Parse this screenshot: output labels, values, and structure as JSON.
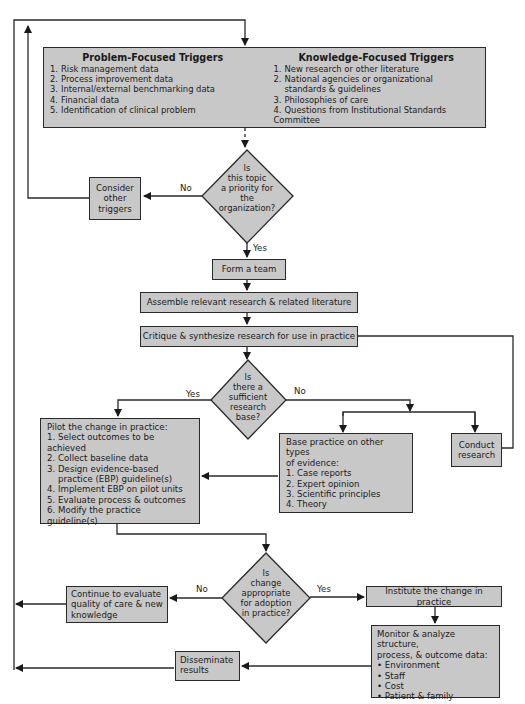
{
  "triggers": {
    "problem": {
      "title": "Problem-Focused Triggers",
      "items": [
        "Risk management data",
        "Process improvement data",
        "Internal/external benchmarking data",
        "Financial data",
        "Identification of clinical problem"
      ]
    },
    "knowledge": {
      "title": "Knowledge-Focused Triggers",
      "items": [
        "New research or other literature",
        "National agencies or organizational",
        "standards & guidelines",
        "Philosophies of care",
        "Questions from Institutional Standards Committee"
      ],
      "numbers": [
        "1.",
        "2.",
        "",
        "3.",
        "4."
      ]
    }
  },
  "decision_priority": {
    "lines": [
      "Is",
      "this topic",
      "a priority for",
      "the",
      "organization?"
    ],
    "no_label": "No",
    "yes_label": "Yes"
  },
  "consider_other_triggers": "Consider other triggers",
  "form_team": "Form a team",
  "assemble": "Assemble relevant research & related literature",
  "critique": "Critique & synthesize research for use in practice",
  "decision_research": {
    "lines": [
      "Is",
      "there a",
      "sufficient",
      "research",
      "base?"
    ],
    "yes_label": "Yes",
    "no_label": "No"
  },
  "pilot": {
    "title": "Pilot the change in practice:",
    "items": [
      "Select outcomes to be achieved",
      "Collect baseline data",
      "Design evidence-based",
      "practice (EBP) guideline(s)",
      "Implement EBP on pilot units",
      "Evaluate process & outcomes",
      "Modify the practice guideline(s)"
    ],
    "numbers": [
      "1.",
      "2.",
      "3.",
      "",
      "4.",
      "5.",
      "6."
    ]
  },
  "base_practice": {
    "title_line1": "Base practice on other types",
    "title_line2": "of evidence:",
    "items": [
      "Case reports",
      "Expert opinion",
      "Scientific principles",
      "Theory"
    ],
    "numbers": [
      "1.",
      "2.",
      "3.",
      "4."
    ]
  },
  "conduct_research": "Conduct research",
  "decision_adoption": {
    "lines": [
      "Is",
      "change",
      "appropriate",
      "for adoption",
      "in practice?"
    ],
    "no_label": "No",
    "yes_label": "Yes"
  },
  "continue_evaluate": {
    "lines": [
      "Continue to evaluate",
      "quality of care & new",
      "knowledge"
    ]
  },
  "institute_change": "Institute the change in practice",
  "monitor": {
    "title_line1": "Monitor & analyze structure,",
    "title_line2": "process, & outcome data:",
    "bullets": [
      "Environment",
      "Staff",
      "Cost",
      "Patient & family"
    ]
  },
  "disseminate": {
    "lines": [
      "Disseminate",
      "results"
    ]
  },
  "colors": {
    "box_fill": "#c8c8c8",
    "stroke": "#2a2a2a",
    "background": "#ffffff"
  }
}
